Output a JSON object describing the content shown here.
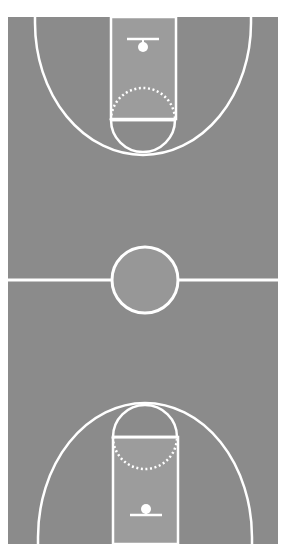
{
  "diagram": {
    "type": "basketball-court",
    "colors": {
      "background": "#ffffff",
      "court": "#8b8b8b",
      "lane": "#9c9c9c",
      "center_circle_fill": "#979797",
      "lines": "#ffffff"
    },
    "court": {
      "x": 8,
      "y": 17,
      "width": 270,
      "height": 527
    },
    "halfcourt_line_y": 280,
    "center_circle": {
      "cx": 145,
      "cy": 280,
      "r": 33
    },
    "top_half": {
      "lane": {
        "x": 111,
        "y": 17,
        "width": 65,
        "height": 102
      },
      "backboard": {
        "x1": 127,
        "x2": 159,
        "y": 39
      },
      "rim": {
        "cx": 143,
        "cy": 47,
        "r": 5
      },
      "free_throw_line_y": 120,
      "free_throw_circle": {
        "cx": 143,
        "cy": 120,
        "r": 32
      },
      "three_point": {
        "left_x": 35,
        "right_x": 251,
        "arc_bottom_y": 155
      }
    },
    "bottom_half": {
      "lane": {
        "x": 113,
        "y": 437,
        "width": 65,
        "height": 107
      },
      "backboard": {
        "x1": 130,
        "x2": 162,
        "y": 515
      },
      "rim": {
        "cx": 146,
        "cy": 509,
        "r": 5
      },
      "free_throw_line_y": 437,
      "free_throw_circle": {
        "cx": 145,
        "cy": 437,
        "r": 32
      },
      "three_point": {
        "left_x": 38,
        "right_x": 252,
        "arc_top_y": 403
      }
    }
  }
}
